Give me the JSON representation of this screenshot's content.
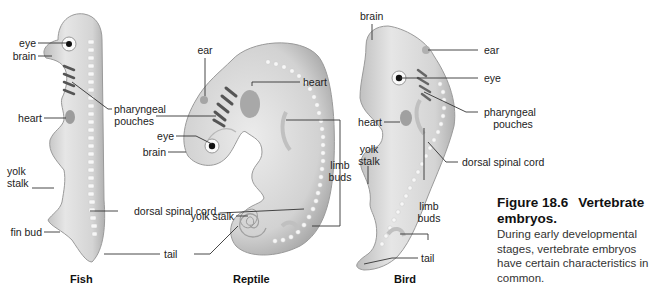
{
  "figure": {
    "number": "Figure 18.6",
    "title": "Vertebrate embryos.",
    "caption": "During early developmental stages, vertebrate embryos have certain characteristics in common."
  },
  "embryos": [
    {
      "name": "Fish",
      "labels": {
        "eye": "eye",
        "brain": "brain",
        "heart": "heart",
        "yolk_stalk_1": "yolk",
        "yolk_stalk_2": "stalk",
        "fin_bud": "fin bud"
      }
    },
    {
      "name": "Reptile",
      "labels": {
        "ear": "ear",
        "heart": "heart",
        "pharyngeal_1": "pharyngeal",
        "pharyngeal_2": "pouches",
        "eye": "eye",
        "brain": "brain",
        "limb_1": "limb",
        "limb_2": "buds",
        "yolk_stalk": "yolk stalk",
        "dorsal": "dorsal spinal cord",
        "tail": "tail"
      }
    },
    {
      "name": "Bird",
      "labels": {
        "brain": "brain",
        "ear": "ear",
        "eye": "eye",
        "pharyngeal_1": "pharyngeal",
        "pharyngeal_2": "pouches",
        "heart": "heart",
        "yolk_stalk_1": "yolk",
        "yolk_stalk_2": "stalk",
        "dorsal": "dorsal spinal cord",
        "limb_1": "limb",
        "limb_2": "buds",
        "tail": "tail"
      }
    }
  ],
  "colors": {
    "body_fill": "#dcdcdc",
    "body_shadow": "#a9a9a9",
    "leader_line": "#333333",
    "text": "#222222"
  }
}
